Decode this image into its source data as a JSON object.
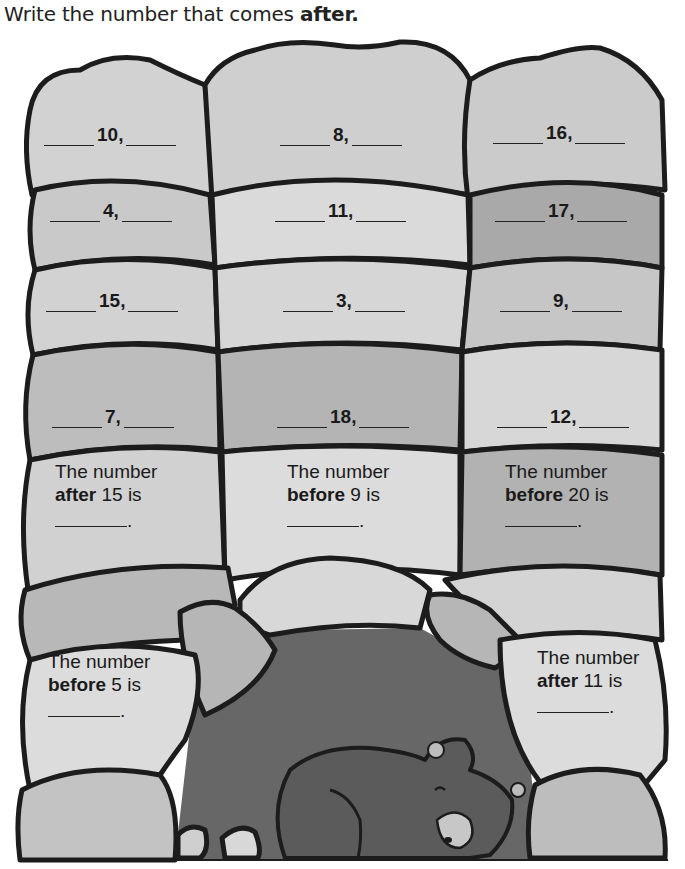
{
  "instructions": {
    "prefix": "Write the number that comes ",
    "emphasis": "after."
  },
  "sequences": [
    {
      "number": "10,"
    },
    {
      "number": "8,"
    },
    {
      "number": "16,"
    },
    {
      "number": "4,"
    },
    {
      "number": "11,"
    },
    {
      "number": "17,"
    },
    {
      "number": "15,"
    },
    {
      "number": "3,"
    },
    {
      "number": "9,"
    },
    {
      "number": "7,"
    },
    {
      "number": "18,"
    },
    {
      "number": "12,"
    }
  ],
  "questions": [
    {
      "line1": "The number",
      "keyword": "after",
      "rest": " 15 is",
      "end": "."
    },
    {
      "line1": "The number",
      "keyword": "before",
      "rest": " 9 is",
      "end": "."
    },
    {
      "line1": "The number",
      "keyword": "before",
      "rest": " 20 is",
      "end": "."
    },
    {
      "line1": "The number",
      "keyword": "before",
      "rest": " 5 is",
      "end": "."
    },
    {
      "line1": "The number",
      "keyword": "after",
      "rest": " 11 is",
      "end": "."
    }
  ],
  "colors": {
    "stone_light": "#d9d9d9",
    "stone_mid": "#c6c6c6",
    "stone_dark": "#adadad",
    "cave": "#6a6a6a",
    "bear": "#5a5a5a",
    "outline": "#1c1c1c"
  }
}
